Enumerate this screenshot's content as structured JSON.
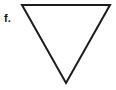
{
  "figure": {
    "label": "f.",
    "background_color": "#ffffff",
    "width": 116,
    "height": 90,
    "shape": {
      "name": "inverted-triangle",
      "kind": "triangle",
      "orientation": "point-down",
      "stroke_color": "#1c1c1c",
      "stroke_width": 2,
      "fill": "none",
      "points": "22,5 110,5 66,83",
      "vertices": [
        {
          "name": "top-left",
          "x": 22,
          "y": 5
        },
        {
          "name": "top-right",
          "x": 110,
          "y": 5
        },
        {
          "name": "bottom-apex",
          "x": 66,
          "y": 83
        }
      ]
    }
  }
}
